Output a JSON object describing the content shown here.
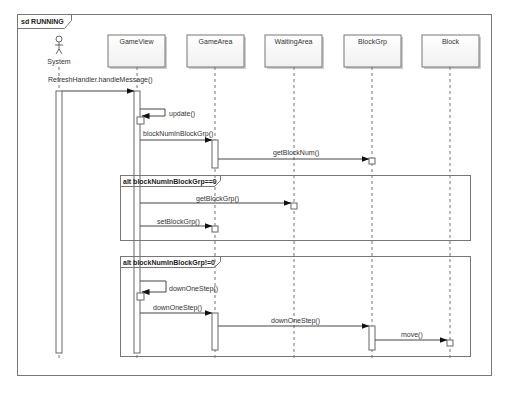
{
  "frame": {
    "kind": "sd",
    "name": "RUNNING",
    "label": "sd RUNNING"
  },
  "actor": {
    "name": "System"
  },
  "lifelines": [
    {
      "name": "GameView",
      "x": 137
    },
    {
      "name": "GameArea",
      "x": 215
    },
    {
      "name": "WaitingArea",
      "x": 294
    },
    {
      "name": "BlockGrp",
      "x": 372
    },
    {
      "name": "Block",
      "x": 450
    }
  ],
  "messages": [
    {
      "label": "RefreshHandler.handleMessage()",
      "from": "System",
      "to": "GameView"
    },
    {
      "label": "update()",
      "from": "GameView",
      "to": "GameView"
    },
    {
      "label": "blockNumInBlockGrp()",
      "from": "GameView",
      "to": "GameArea"
    },
    {
      "label": "getBlockNum()",
      "from": "GameArea",
      "to": "BlockGrp"
    },
    {
      "label": "getBlockGrp()",
      "from": "GameView",
      "to": "WaitingArea"
    },
    {
      "label": "setBlockGrp()",
      "from": "GameView",
      "to": "GameArea"
    },
    {
      "label": "downOneStep()",
      "from": "GameView",
      "to": "GameView"
    },
    {
      "label": "downOneStep()",
      "from": "GameView",
      "to": "GameArea"
    },
    {
      "label": "downOneStep()",
      "from": "GameArea",
      "to": "BlockGrp"
    },
    {
      "label": "move()",
      "from": "BlockGrp",
      "to": "Block"
    }
  ],
  "fragments": [
    {
      "operator": "alt",
      "guard": "blockNumInBlockGrp==0",
      "label": "alt blockNumInBlockGrp==0"
    },
    {
      "operator": "alt",
      "guard": "blockNumInBlockGrp!=0",
      "label": "alt blockNumInBlockGrp!=0"
    }
  ],
  "colors": {
    "line": "#555555",
    "box_fill": "#f7f7f7",
    "shadow": "#bbbbbb",
    "text": "#333333"
  }
}
